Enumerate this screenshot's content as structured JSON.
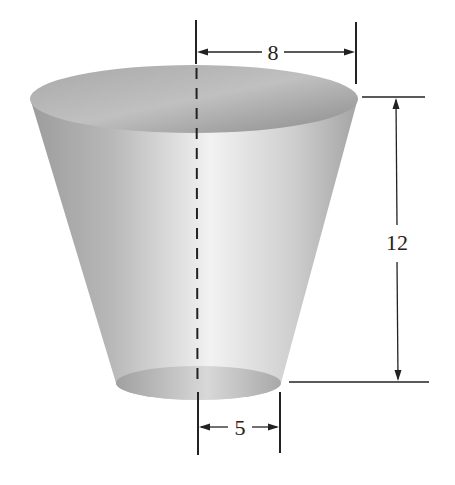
{
  "figure": {
    "type": "frustum-of-cone",
    "dimensions": {
      "top_radius": {
        "label": "8",
        "value": 8
      },
      "height": {
        "label": "12",
        "value": 12
      },
      "bottom_radius": {
        "label": "5",
        "value": 5
      }
    },
    "colors": {
      "background": "#ffffff",
      "line": "#222222",
      "body_edge": "#9a9a9a",
      "body_highlight": "#f4f4f4",
      "rim_dark": "#8a8a8a",
      "rim_light": "#c8c8c8"
    }
  }
}
